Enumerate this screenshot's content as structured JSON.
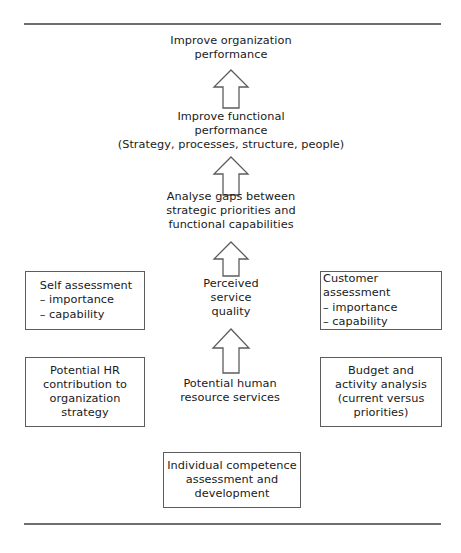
{
  "figure": {
    "type": "flow-diagram",
    "orientation": "bottom-up",
    "rules": {
      "top_label": "top-horizontal-rule",
      "bottom_label": "bottom-horizontal-rule"
    },
    "nodes": {
      "improve_organization_performance": "Improve organization\nperformance",
      "improve_functional_performance": "Improve functional\nperformance\n(Strategy, processes, structure, people)",
      "analyse_gaps": "Analyse gaps between\nstrategic priorities and\nfunctional capabilities",
      "perceived_service_quality": "Perceived\nservice\nquality",
      "potential_human_resource_services": "Potential human\nresource services",
      "self_assessment": "Self assessment\n– importance\n– capability",
      "customer_assessment": "Customer assessment\n– importance\n– capability",
      "potential_hr_contribution": "Potential HR\ncontribution to\norganization\nstrategy",
      "budget_and_activity_analysis": "Budget and\nactivity analysis\n(current versus\npriorities)",
      "individual_competence": "Individual competence\nassessment and\ndevelopment"
    },
    "arrows": {
      "functional_to_organization": "up-arrow",
      "gaps_to_functional": "up-arrow",
      "quality_to_gaps": "up-arrow",
      "services_to_quality": "up-arrow"
    },
    "colors": {
      "text": "#1a1a1a",
      "box_border": "#5c5c5c",
      "rule": "#6e6e6e",
      "arrow_stroke": "#5c5c5c",
      "background": "#ffffff"
    }
  }
}
